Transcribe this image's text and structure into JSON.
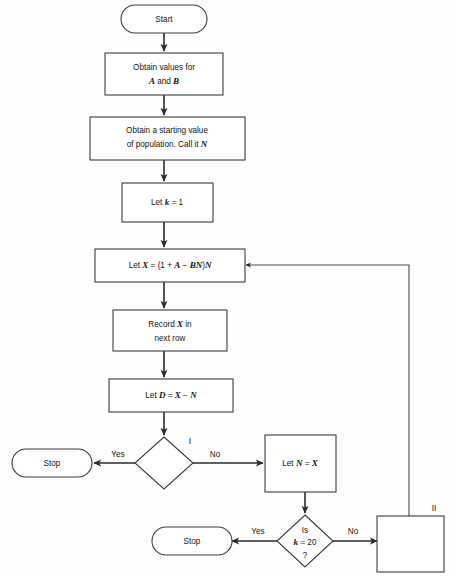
{
  "diagram": {
    "type": "flowchart",
    "background_color": "#fefefe",
    "line_color": "#2b2b2b",
    "shape_fill": "#ffffff"
  },
  "nodes": {
    "start": {
      "label": "Start",
      "shape": "terminator"
    },
    "obtain_ab": {
      "line1": "Obtain values for",
      "line2_pre": "",
      "var_a": "A",
      "mid": " and ",
      "var_b": "B",
      "shape": "process"
    },
    "obtain_pop": {
      "line1": "Obtain a starting value",
      "line2": "of population. Call it ",
      "var_n": "N",
      "shape": "process"
    },
    "let_k": {
      "pre": "Let ",
      "var_k": "k",
      "post": " = 1",
      "shape": "process"
    },
    "let_x": {
      "pre": "Let ",
      "var_x": "X",
      "eq": " = (1 + ",
      "var_a": "A",
      "minus": " − ",
      "var_bn": "BN",
      "close": ")",
      "var_n": "N",
      "shape": "process"
    },
    "record_x": {
      "line1_pre": "Record ",
      "var_x": "X",
      "line1_post": " in",
      "line2": "next row",
      "shape": "process"
    },
    "let_d": {
      "pre": "Let ",
      "var_d": "D",
      "eq": " = ",
      "var_x": "X",
      "minus": " − ",
      "var_n": "N",
      "shape": "process"
    },
    "decision_i": {
      "label": "",
      "marker": "I",
      "shape": "decision"
    },
    "stop_left": {
      "label": "Stop",
      "shape": "terminator"
    },
    "let_n": {
      "pre": "Let ",
      "var_n": "N",
      "eq": " = ",
      "var_x": "X",
      "shape": "process"
    },
    "decision_k": {
      "line1": "Is",
      "var_k": "k",
      "line2_post": " = 20",
      "line3": "?",
      "shape": "decision"
    },
    "stop_bottom": {
      "label": "Stop",
      "shape": "terminator"
    },
    "box_ii": {
      "label": "",
      "marker": "II",
      "shape": "process"
    }
  },
  "edge_labels": {
    "yes_upper": "Yes",
    "no_upper": "No",
    "yes_lower": "Yes",
    "no_lower": "No"
  },
  "markers": {
    "one": "I",
    "two": "II"
  }
}
